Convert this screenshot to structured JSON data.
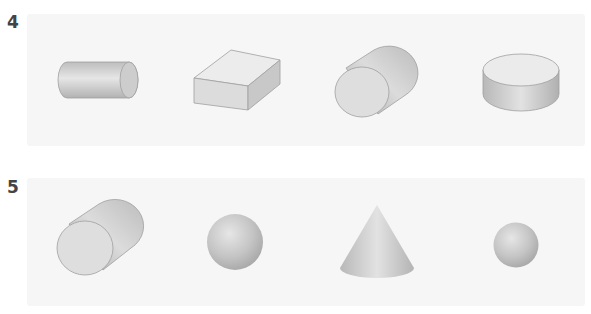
{
  "questions": [
    {
      "number": "4",
      "shapes": [
        {
          "name": "cylinder-horizontal",
          "label": "cylinder"
        },
        {
          "name": "rectangular-prism",
          "label": "rectangular prism"
        },
        {
          "name": "cylinder-tilted",
          "label": "cylinder"
        },
        {
          "name": "cylinder-short",
          "label": "cylinder"
        }
      ]
    },
    {
      "number": "5",
      "shapes": [
        {
          "name": "cylinder-tilted",
          "label": "cylinder"
        },
        {
          "name": "sphere-large",
          "label": "sphere"
        },
        {
          "name": "cone",
          "label": "cone"
        },
        {
          "name": "sphere-small",
          "label": "sphere"
        }
      ]
    }
  ],
  "colors": {
    "panel": "#f6f6f6",
    "shape_light": "#e4e4e4",
    "shape_mid": "#cfcfcf",
    "shape_dark": "#a8a8a8",
    "outline": "#a0a0a0",
    "number": "#444444"
  }
}
